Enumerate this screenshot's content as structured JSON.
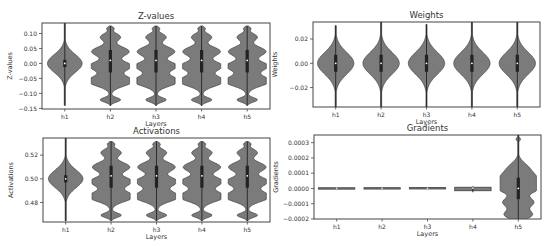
{
  "figure": {
    "width": 553,
    "height": 246,
    "violin_fill": "#7b7b7b",
    "violin_edge": "#3f3f3f",
    "box_color": "#222222",
    "median_color": "#ffffff",
    "frame_color": "#444444"
  },
  "chart_data": [
    {
      "type": "violin",
      "title": "Z-values",
      "xlabel": "Layers",
      "ylabel": "Z-values",
      "categories": [
        "h1",
        "h2",
        "h3",
        "h4",
        "h5"
      ],
      "yticks": [
        0.1,
        0.05,
        0.0,
        -0.05,
        -0.1,
        -0.15
      ],
      "ytick_labels": [
        "0.10",
        "0.05",
        "0.00",
        "−0.05",
        "−0.10",
        "−0.15"
      ],
      "ylim": [
        -0.152,
        0.135
      ],
      "frame": {
        "x": 42,
        "y": 23,
        "w": 228,
        "h": 86
      },
      "series": [
        {
          "name": "h1",
          "shape": "smooth",
          "min": -0.14,
          "max": 0.14,
          "median": 0.0,
          "q1": -0.012,
          "q3": 0.012,
          "width": 0.95,
          "center": 0.0,
          "spread": 0.03
        },
        {
          "name": "h2",
          "shape": "lobed",
          "min": -0.14,
          "max": 0.125,
          "median": 0.01,
          "q1": -0.03,
          "q3": 0.045,
          "width": 1.0
        },
        {
          "name": "h3",
          "shape": "lobed",
          "min": -0.14,
          "max": 0.125,
          "median": 0.01,
          "q1": -0.03,
          "q3": 0.045,
          "width": 1.0
        },
        {
          "name": "h4",
          "shape": "lobed",
          "min": -0.14,
          "max": 0.125,
          "median": 0.01,
          "q1": -0.03,
          "q3": 0.045,
          "width": 1.0
        },
        {
          "name": "h5",
          "shape": "lobed",
          "min": -0.14,
          "max": 0.125,
          "median": 0.01,
          "q1": -0.03,
          "q3": 0.045,
          "width": 1.0
        }
      ]
    },
    {
      "type": "violin",
      "title": "Weights",
      "xlabel": "Layers",
      "ylabel": "Weights",
      "categories": [
        "h1",
        "h2",
        "h3",
        "h4",
        "h5"
      ],
      "yticks": [
        0.02,
        0.0,
        -0.02
      ],
      "ytick_labels": [
        "0.02",
        "0.00",
        "−0.02"
      ],
      "ylim": [
        -0.036,
        0.034
      ],
      "frame": {
        "x": 313,
        "y": 22,
        "w": 227,
        "h": 85
      },
      "series": [
        {
          "name": "h1",
          "shape": "smooth",
          "min": -0.036,
          "max": 0.031,
          "median": 0.0,
          "q1": -0.007,
          "q3": 0.007,
          "width": 1.0,
          "center": 0.0,
          "spread": 0.009
        },
        {
          "name": "h2",
          "shape": "smooth",
          "min": -0.036,
          "max": 0.034,
          "median": 0.0,
          "q1": -0.007,
          "q3": 0.007,
          "width": 1.0,
          "center": 0.0,
          "spread": 0.009
        },
        {
          "name": "h3",
          "shape": "smooth",
          "min": -0.036,
          "max": 0.032,
          "median": 0.0,
          "q1": -0.007,
          "q3": 0.007,
          "width": 1.0,
          "center": 0.0,
          "spread": 0.009
        },
        {
          "name": "h4",
          "shape": "smooth",
          "min": -0.036,
          "max": 0.034,
          "median": 0.0,
          "q1": -0.007,
          "q3": 0.007,
          "width": 1.0,
          "center": 0.0,
          "spread": 0.009
        },
        {
          "name": "h5",
          "shape": "smooth",
          "min": -0.036,
          "max": 0.034,
          "median": 0.0,
          "q1": -0.007,
          "q3": 0.007,
          "width": 1.0,
          "center": 0.0,
          "spread": 0.009
        }
      ]
    },
    {
      "type": "violin",
      "title": "Activations",
      "xlabel": "Layers",
      "ylabel": "Activations",
      "categories": [
        "h1",
        "h2",
        "h3",
        "h4",
        "h5"
      ],
      "yticks": [
        0.52,
        0.5,
        0.48
      ],
      "ytick_labels": [
        "0.52",
        "0.50",
        "0.48"
      ],
      "ylim": [
        0.4635,
        0.5345
      ],
      "frame": {
        "x": 43,
        "y": 138,
        "w": 227,
        "h": 84
      },
      "series": [
        {
          "name": "h1",
          "shape": "smooth",
          "min": 0.4645,
          "max": 0.5345,
          "median": 0.5,
          "q1": 0.497,
          "q3": 0.503,
          "width": 0.95,
          "center": 0.5,
          "spread": 0.0075
        },
        {
          "name": "h2",
          "shape": "lobed",
          "min": 0.4645,
          "max": 0.5315,
          "median": 0.5025,
          "q1": 0.4925,
          "q3": 0.511,
          "width": 1.0
        },
        {
          "name": "h3",
          "shape": "lobed",
          "min": 0.4645,
          "max": 0.5315,
          "median": 0.5025,
          "q1": 0.4925,
          "q3": 0.511,
          "width": 1.0
        },
        {
          "name": "h4",
          "shape": "lobed",
          "min": 0.4645,
          "max": 0.5315,
          "median": 0.5025,
          "q1": 0.4925,
          "q3": 0.511,
          "width": 1.0
        },
        {
          "name": "h5",
          "shape": "lobed",
          "min": 0.4645,
          "max": 0.5315,
          "median": 0.5025,
          "q1": 0.4925,
          "q3": 0.511,
          "width": 1.0
        }
      ]
    },
    {
      "type": "violin",
      "title": "Gradients",
      "xlabel": "Layers",
      "ylabel": "Gradients",
      "categories": [
        "h1",
        "h2",
        "h3",
        "h4",
        "h5"
      ],
      "yticks": [
        0.0003,
        0.0002,
        0.0001,
        0.0,
        -0.0001,
        -0.0002
      ],
      "ytick_labels": [
        "0.0003",
        "0.0002",
        "0.0001",
        "0.0000",
        "−0.0001",
        "−0.0002"
      ],
      "ylim": [
        -0.0002,
        0.00035
      ],
      "frame": {
        "x": 314,
        "y": 135,
        "w": 227,
        "h": 84
      },
      "series": [
        {
          "name": "h1",
          "shape": "flat",
          "min": -2e-06,
          "max": 2e-06,
          "median": 0.0,
          "q1": -1e-06,
          "q3": 1e-06,
          "width": 1.0
        },
        {
          "name": "h2",
          "shape": "flat",
          "min": -2e-06,
          "max": 3e-06,
          "median": 1e-06,
          "q1": 0.0,
          "q3": 2e-06,
          "width": 1.0
        },
        {
          "name": "h3",
          "shape": "flat",
          "min": -2e-06,
          "max": 4e-06,
          "median": 1e-06,
          "q1": 0.0,
          "q3": 3e-06,
          "width": 1.0
        },
        {
          "name": "h4",
          "shape": "flat",
          "min": -1.5e-05,
          "max": 8e-06,
          "median": 3e-06,
          "q1": 0.0,
          "q3": 6e-06,
          "width": 1.0
        },
        {
          "name": "h5",
          "shape": "gradient_h5",
          "min": -0.0002,
          "max": 0.00035,
          "median": 0.0,
          "q1": -7e-05,
          "q3": 7e-05,
          "width": 1.0
        }
      ]
    }
  ]
}
